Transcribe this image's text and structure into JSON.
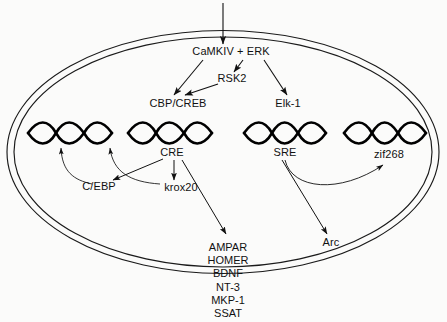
{
  "figure": {
    "type": "cell-signaling-pathway-diagram",
    "background_color": "#fbfbfa",
    "line_color": "#111111"
  },
  "membrane": {
    "name": "nuclear-membrane",
    "shape": "double-ellipse",
    "cx": 223,
    "cy": 152,
    "rx_outer": 216,
    "ry_outer": 122,
    "rx_inner": 209,
    "ry_inner": 115
  },
  "nodes": {
    "input_arrow": {
      "label": "",
      "x": 223,
      "y": 8
    },
    "camkiv_erk": {
      "label": "CaMKIV + ERK",
      "x": 231,
      "y": 52
    },
    "rsk2": {
      "label": "RSK2",
      "x": 232,
      "y": 79
    },
    "cbp_creb": {
      "label": "CBP/CREB",
      "x": 178,
      "y": 104
    },
    "elk1": {
      "label": "Elk-1",
      "x": 288,
      "y": 104
    },
    "cre": {
      "label": "CRE",
      "x": 172,
      "y": 153
    },
    "sre": {
      "label": "SRE",
      "x": 285,
      "y": 153
    },
    "zif268": {
      "label": "zif268",
      "x": 389,
      "y": 155
    },
    "cebp": {
      "label": "C/EBP",
      "x": 99,
      "y": 187
    },
    "krox20": {
      "label": "krox20",
      "x": 181,
      "y": 188
    },
    "arc": {
      "label": "Arc",
      "x": 331,
      "y": 243
    }
  },
  "dna_elements": [
    {
      "name": "dna-helix-1",
      "x": 28,
      "y": 126,
      "width": 84
    },
    {
      "name": "dna-helix-2",
      "x": 128,
      "y": 126,
      "width": 84
    },
    {
      "name": "dna-helix-3",
      "x": 244,
      "y": 126,
      "width": 82
    },
    {
      "name": "dna-helix-4",
      "x": 344,
      "y": 126,
      "width": 82
    }
  ],
  "gene_list": {
    "name": "induced-gene-list",
    "x": 228,
    "y": 241,
    "items": [
      "AMPAR",
      "HOMER",
      "BDNF",
      "NT-3",
      "MKP-1",
      "SSAT"
    ]
  },
  "edges": [
    {
      "name": "edge-input-to-camkiv",
      "from": "input",
      "to": "CaMKIV + ERK",
      "style": "straight-arrow"
    },
    {
      "name": "edge-camkiv-to-rsk2",
      "from": "CaMKIV + ERK",
      "to": "RSK2",
      "style": "straight-arrow"
    },
    {
      "name": "edge-camkiv-to-cbpcreb",
      "from": "CaMKIV + ERK",
      "to": "CBP/CREB",
      "style": "straight-arrow"
    },
    {
      "name": "edge-rsk2-to-cbpcreb",
      "from": "RSK2",
      "to": "CBP/CREB",
      "style": "straight-arrow"
    },
    {
      "name": "edge-camkiv-to-elk1",
      "from": "CaMKIV + ERK",
      "to": "Elk-1",
      "style": "straight-arrow"
    },
    {
      "name": "edge-cre-to-cebp",
      "from": "CRE",
      "to": "C/EBP",
      "style": "straight-arrow"
    },
    {
      "name": "edge-cre-to-krox20",
      "from": "CRE",
      "to": "krox20",
      "style": "straight-arrow"
    },
    {
      "name": "edge-cre-to-genes",
      "from": "CRE",
      "to": "gene-list",
      "style": "straight-arrow"
    },
    {
      "name": "edge-cebp-to-dna1",
      "from": "C/EBP",
      "to": "dna-helix-1",
      "style": "curved-arrow"
    },
    {
      "name": "edge-krox20-to-dna2",
      "from": "krox20",
      "to": "dna-helix-2",
      "style": "curved-arrow"
    },
    {
      "name": "edge-sre-to-arc",
      "from": "SRE",
      "to": "Arc",
      "style": "straight-arrow"
    },
    {
      "name": "edge-sre-to-zif268",
      "from": "SRE",
      "to": "zif268",
      "style": "curved-arrow"
    }
  ]
}
